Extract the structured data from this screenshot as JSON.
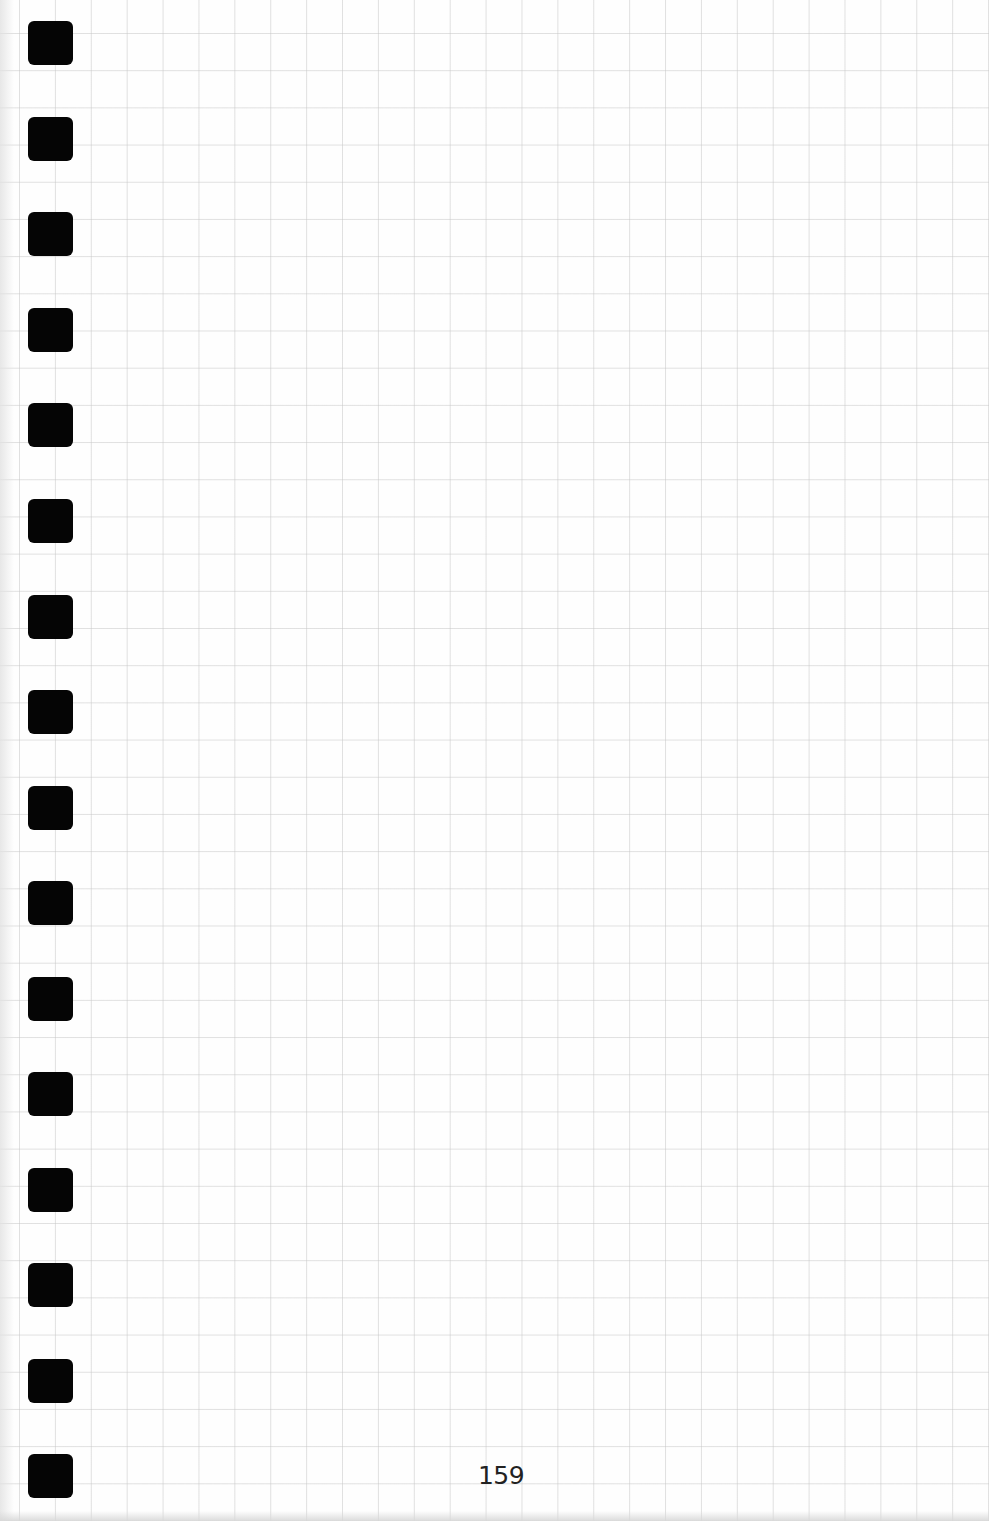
{
  "page": {
    "type": "grid-paper-journal-page",
    "page_number": "159",
    "grid_color": "#c8c8c8",
    "background_color": "#fefefe",
    "tab_color": "#050505"
  },
  "binder_tabs": {
    "count": 16,
    "positions_top": [
      21,
      117,
      212,
      308,
      403,
      499,
      595,
      690,
      786,
      881,
      977,
      1072,
      1168,
      1263,
      1359,
      1454
    ]
  }
}
